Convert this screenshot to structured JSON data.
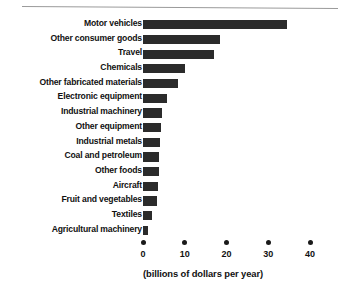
{
  "chart_data": {
    "type": "bar",
    "orientation": "horizontal",
    "title": "",
    "subtitle": "",
    "xlabel": "(billions of dollars per year)",
    "ylabel": "",
    "xlim": [
      0,
      40
    ],
    "xticks": [
      0,
      10,
      20,
      30,
      40
    ],
    "xtick_labels": [
      "0",
      "10",
      "20",
      "30",
      "40"
    ],
    "grid": false,
    "legend": null,
    "bar_color": "#2b2b2b",
    "categories": [
      "Motor vehicles",
      "Other consumer goods",
      "Travel",
      "Chemicals",
      "Other fabricated materials",
      "Electronic equipment",
      "Industrial machinery",
      "Other equipment",
      "Industrial metals",
      "Coal and petroleum",
      "Other foods",
      "Aircraft",
      "Fruit and vegetables",
      "Textiles",
      "Agricultural machinery"
    ],
    "values": [
      34.5,
      18.5,
      17.0,
      10.0,
      8.4,
      5.7,
      4.6,
      4.3,
      4.1,
      3.8,
      3.8,
      3.5,
      3.3,
      2.2,
      1.2
    ]
  },
  "axis": {
    "caption": "(billions of dollars per year)"
  }
}
